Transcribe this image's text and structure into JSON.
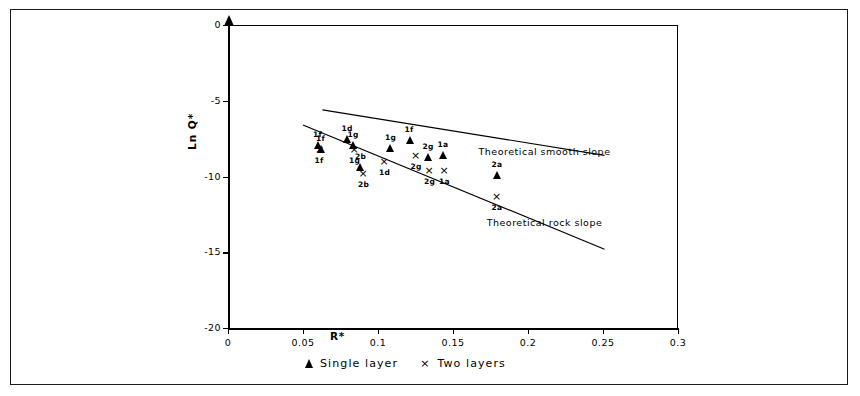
{
  "chart_data": {
    "type": "scatter",
    "title": "",
    "xlabel": "R*",
    "ylabel": "Ln Q*",
    "xlim": [
      0,
      0.3
    ],
    "ylim": [
      -20,
      0
    ],
    "xticks": [
      "0",
      "0.05",
      "0.1",
      "0.15",
      "0.2",
      "0.25",
      "0.3"
    ],
    "xtick_values": [
      0,
      0.05,
      0.1,
      0.15,
      0.2,
      0.25,
      0.3
    ],
    "yticks": [
      "0",
      "-5",
      "-10",
      "-15",
      "-20"
    ],
    "ytick_values": [
      0,
      -5,
      -10,
      -15,
      -20
    ],
    "grid": false,
    "legend_position": "below-axes",
    "series": [
      {
        "name": "Single layer",
        "marker": "triangle",
        "points": [
          {
            "label": "1f",
            "x": 0.06,
            "y": -7.9
          },
          {
            "label": "1f",
            "x": 0.062,
            "y": -8.2
          },
          {
            "label": "1d",
            "x": 0.079,
            "y": -7.5
          },
          {
            "label": "1g",
            "x": 0.083,
            "y": -7.9
          },
          {
            "label": "2b",
            "x": 0.088,
            "y": -9.4
          },
          {
            "label": "1g",
            "x": 0.108,
            "y": -8.1
          },
          {
            "label": "1f",
            "x": 0.121,
            "y": -7.6
          },
          {
            "label": "2g",
            "x": 0.133,
            "y": -8.7
          },
          {
            "label": "1a",
            "x": 0.143,
            "y": -8.6
          },
          {
            "label": "2a",
            "x": 0.179,
            "y": -9.9
          }
        ]
      },
      {
        "name": "Two layers",
        "marker": "x",
        "points": [
          {
            "label": "1f",
            "x": 0.061,
            "y": -8.3
          },
          {
            "label": "1g",
            "x": 0.084,
            "y": -8.3
          },
          {
            "label": "2b",
            "x": 0.09,
            "y": -9.9
          },
          {
            "label": "1d",
            "x": 0.104,
            "y": -9.1
          },
          {
            "label": "2g",
            "x": 0.125,
            "y": -8.7
          },
          {
            "label": "2g",
            "x": 0.134,
            "y": -9.7
          },
          {
            "label": "1a",
            "x": 0.144,
            "y": -9.7
          },
          {
            "label": "2a",
            "x": 0.179,
            "y": -11.4
          }
        ]
      }
    ],
    "trend_lines": [
      {
        "name": "Theoretical smooth slope",
        "label": "Theoretical smooth slope",
        "x_start": 0.063,
        "y_start": -5.6,
        "x_end": 0.251,
        "y_end": -8.6,
        "label_x": 0.211,
        "label_y": -8.35
      },
      {
        "name": "Theoretical rock slope",
        "label": "Theoretical rock slope",
        "x_start": 0.05,
        "y_start": -6.6,
        "x_end": 0.251,
        "y_end": -14.8,
        "label_x": 0.211,
        "label_y": -13.1
      }
    ],
    "legend": [
      {
        "marker": "triangle",
        "label": "Single layer"
      },
      {
        "marker": "x",
        "label": "Two layers"
      }
    ]
  },
  "axes": {
    "x_title": "R*",
    "y_title": "Ln Q*"
  },
  "legend": {
    "single_layer_label": "Single layer",
    "two_layers_label": "Two layers"
  },
  "annotations": {
    "smooth_slope": "Theoretical smooth slope",
    "rock_slope": "Theoretical rock slope"
  }
}
